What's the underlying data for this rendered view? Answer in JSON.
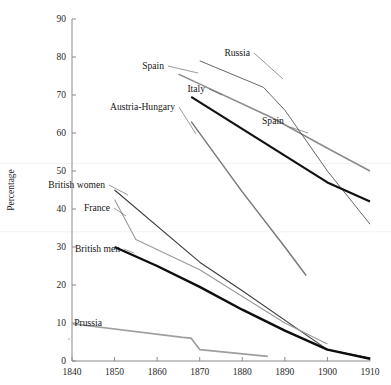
{
  "chart_data": {
    "type": "line",
    "title": "",
    "subtitle": "",
    "xlabel": "",
    "ylabel": "Percentage",
    "xlim": [
      1840,
      1910
    ],
    "ylim": [
      0,
      90
    ],
    "xticks": [
      1840,
      1850,
      1860,
      1870,
      1880,
      1890,
      1900,
      1910
    ],
    "yticks": [
      0,
      10,
      20,
      30,
      40,
      50,
      60,
      70,
      80,
      90
    ],
    "grid": false,
    "legend": "inline-labels",
    "series": [
      {
        "name": "Spain",
        "label": "Spain",
        "color": "#8c8c8c",
        "width": 1.6,
        "x": [
          1865,
          1887,
          1900,
          1910
        ],
        "values": [
          75.5,
          64.0,
          56.0,
          50.0
        ]
      },
      {
        "name": "Russia",
        "label": "Russia",
        "color": "#555555",
        "width": 0.9,
        "x": [
          1870,
          1885,
          1890,
          1900,
          1910
        ],
        "values": [
          79.0,
          72.0,
          66.0,
          50.0,
          36.0
        ]
      },
      {
        "name": "Italy",
        "label": "Italy",
        "color": "#111111",
        "width": 2.2,
        "x": [
          1868,
          1900,
          1910
        ],
        "values": [
          69.5,
          47.0,
          42.0
        ]
      },
      {
        "name": "Austria-Hungary",
        "label": "Austria-Hungary",
        "color": "#7a7a7a",
        "width": 1.5,
        "x": [
          1868,
          1880,
          1890,
          1895
        ],
        "values": [
          63.0,
          44.5,
          30.0,
          22.5
        ]
      },
      {
        "name": "British women",
        "label": "British women",
        "color": "#3d3d3d",
        "width": 1.1,
        "x": [
          1850,
          1870,
          1880,
          1900,
          1910
        ],
        "values": [
          45.0,
          26.0,
          18.5,
          3.0,
          0.8
        ]
      },
      {
        "name": "France",
        "label": "France",
        "color": "#9a9a9a",
        "width": 1.1,
        "x": [
          1850,
          1855,
          1870,
          1890,
          1900
        ],
        "values": [
          42.5,
          32.0,
          24.0,
          10.0,
          4.5
        ]
      },
      {
        "name": "British men",
        "label": "British men",
        "color": "#0d0d0d",
        "width": 2.4,
        "x": [
          1850,
          1860,
          1870,
          1880,
          1890,
          1900,
          1910
        ],
        "values": [
          30.0,
          25.0,
          19.5,
          13.5,
          8.0,
          3.0,
          0.6
        ]
      },
      {
        "name": "Prussia",
        "label": "Prussia",
        "color": "#9e9e9e",
        "width": 1.7,
        "x": [
          1840,
          1866,
          1868,
          1870,
          1886
        ],
        "values": [
          9.8,
          6.2,
          6.0,
          3.0,
          1.2
        ]
      }
    ],
    "annotations": [
      {
        "name": "Spain",
        "text": "Spain",
        "anchor": "end",
        "tx": 164,
        "ty": 69,
        "lx1": 168,
        "ly1": 66,
        "lx2": 198,
        "ly2": 73
      },
      {
        "name": "Russia",
        "text": "Russia",
        "anchor": "end",
        "tx": 250,
        "ty": 56,
        "lx1": 254,
        "ly1": 53,
        "lx2": 283,
        "ly2": 79
      },
      {
        "name": "Italy",
        "text": "Italy",
        "anchor": "end",
        "tx": 205,
        "ty": 92,
        "lx1": 209,
        "ly1": 89,
        "lx2": 222,
        "ly2": 95
      },
      {
        "name": "Austria-Hungary",
        "text": "Austria-Hungary",
        "anchor": "end",
        "tx": 175,
        "ty": 110,
        "lx1": 179,
        "ly1": 107,
        "lx2": 196,
        "ly2": 134
      },
      {
        "name": "Spain-right",
        "text": "Spain",
        "anchor": "start",
        "tx": 262,
        "ty": 124,
        "lx1": 290,
        "ly1": 127,
        "lx2": 308,
        "ly2": 133
      },
      {
        "name": "British women",
        "text": "British women",
        "anchor": "end",
        "tx": 105,
        "ty": 188,
        "lx1": 109,
        "ly1": 185,
        "lx2": 128,
        "ly2": 195
      },
      {
        "name": "France",
        "text": "France",
        "anchor": "end",
        "tx": 110,
        "ty": 211,
        "lx1": 114,
        "ly1": 208,
        "lx2": 126,
        "ly2": 216
      },
      {
        "name": "British men",
        "text": "British men",
        "anchor": "end",
        "tx": 120,
        "ty": 252,
        "lx1": 124,
        "ly1": 249,
        "lx2": 134,
        "ly2": 253
      },
      {
        "name": "Prussia",
        "text": "Prussia",
        "anchor": "end",
        "tx": 102,
        "ty": 326,
        "lx1": 0,
        "ly1": 0,
        "lx2": 0,
        "ly2": 0
      }
    ]
  },
  "axes": {
    "y_title": "Percentage",
    "y_tick_labels": [
      "0",
      "10",
      "20",
      "30",
      "40",
      "50",
      "60",
      "70",
      "80",
      "90"
    ],
    "x_tick_labels": [
      "1840",
      "1850",
      "1860",
      "1870",
      "1880",
      "1890",
      "1900",
      "1910"
    ]
  }
}
